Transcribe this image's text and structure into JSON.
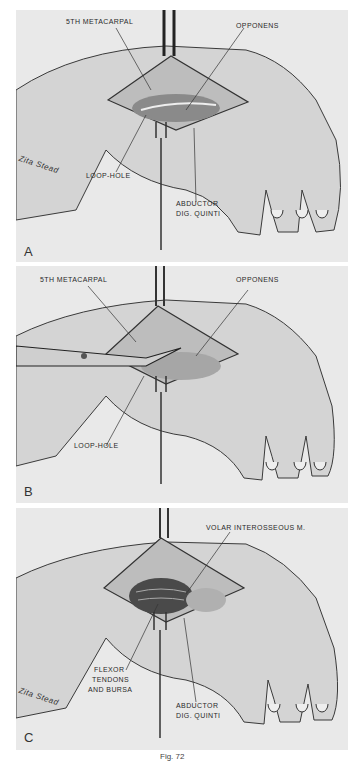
{
  "figure": {
    "caption": "Fig. 72",
    "signature": "Zita Stead",
    "background_color": "#e9e9e9",
    "line_color": "#2a2a2a"
  },
  "panels": [
    {
      "id": "A",
      "letter": "A",
      "labels": [
        "5th Metacarpal",
        "Opponens",
        "Loop-hole",
        "Abductor",
        "Dig. Quinti"
      ],
      "signature": "Zita Stead"
    },
    {
      "id": "B",
      "letter": "B",
      "labels": [
        "5th Metacarpal",
        "Opponens",
        "Loop-hole"
      ]
    },
    {
      "id": "C",
      "letter": "C",
      "labels": [
        "Volar Interosseous M.",
        "Flexor",
        "Tendons",
        "and Bursa",
        "Abductor",
        "Dig. Quinti"
      ],
      "signature": "Zita Stead"
    }
  ]
}
